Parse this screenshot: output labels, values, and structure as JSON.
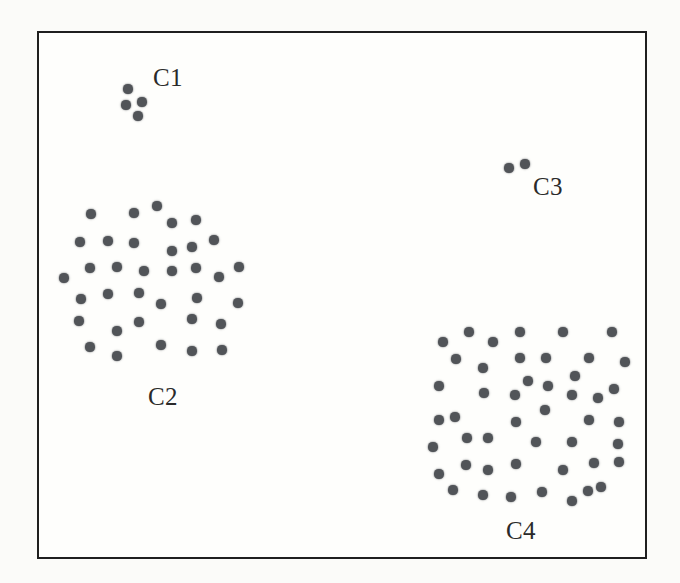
{
  "figure": {
    "page_background": "#fbfbf9",
    "plot_background": "#fefefc",
    "border_color": "#1f1f1f",
    "border_width_px": 2
  },
  "chart_data": {
    "type": "scatter",
    "title": "",
    "xlabel": "",
    "ylabel": "",
    "axes_visible": false,
    "grid": false,
    "legend": false,
    "coordinate_space": "screenshot pixels, origin at top-left",
    "point_color": "#515458",
    "point_radius_px": 4.6,
    "label_color": "#2a2a2a",
    "series": [
      {
        "name": "C1",
        "label": "C1",
        "label_center": [
          168,
          77
        ],
        "points": [
          [
            128,
            89
          ],
          [
            126,
            105
          ],
          [
            142,
            102
          ],
          [
            138,
            116
          ]
        ]
      },
      {
        "name": "C2",
        "label": "C2",
        "label_center": [
          163,
          396
        ],
        "points": [
          [
            91,
            214
          ],
          [
            134,
            213
          ],
          [
            157,
            206
          ],
          [
            172,
            223
          ],
          [
            196,
            220
          ],
          [
            80,
            242
          ],
          [
            108,
            241
          ],
          [
            134,
            243
          ],
          [
            214,
            240
          ],
          [
            172,
            251
          ],
          [
            192,
            247
          ],
          [
            90,
            268
          ],
          [
            117,
            267
          ],
          [
            144,
            271
          ],
          [
            172,
            271
          ],
          [
            196,
            268
          ],
          [
            239,
            267
          ],
          [
            64,
            278
          ],
          [
            219,
            277
          ],
          [
            81,
            299
          ],
          [
            108,
            294
          ],
          [
            139,
            293
          ],
          [
            197,
            298
          ],
          [
            161,
            304
          ],
          [
            238,
            303
          ],
          [
            79,
            321
          ],
          [
            139,
            322
          ],
          [
            192,
            319
          ],
          [
            117,
            331
          ],
          [
            221,
            324
          ],
          [
            90,
            347
          ],
          [
            161,
            345
          ],
          [
            192,
            351
          ],
          [
            222,
            350
          ],
          [
            117,
            356
          ]
        ]
      },
      {
        "name": "C3",
        "label": "C3",
        "label_center": [
          548,
          186
        ],
        "points": [
          [
            509,
            168
          ],
          [
            525,
            164
          ]
        ]
      },
      {
        "name": "C4",
        "label": "C4",
        "label_center": [
          521,
          530
        ],
        "points": [
          [
            443,
            342
          ],
          [
            469,
            332
          ],
          [
            493,
            342
          ],
          [
            520,
            332
          ],
          [
            563,
            332
          ],
          [
            612,
            332
          ],
          [
            456,
            359
          ],
          [
            520,
            358
          ],
          [
            546,
            358
          ],
          [
            589,
            358
          ],
          [
            625,
            362
          ],
          [
            483,
            368
          ],
          [
            575,
            376
          ],
          [
            439,
            386
          ],
          [
            528,
            381
          ],
          [
            548,
            386
          ],
          [
            614,
            389
          ],
          [
            484,
            393
          ],
          [
            515,
            395
          ],
          [
            572,
            395
          ],
          [
            598,
            398
          ],
          [
            545,
            410
          ],
          [
            439,
            420
          ],
          [
            455,
            417
          ],
          [
            516,
            422
          ],
          [
            589,
            420
          ],
          [
            619,
            422
          ],
          [
            467,
            438
          ],
          [
            488,
            438
          ],
          [
            536,
            442
          ],
          [
            572,
            442
          ],
          [
            433,
            447
          ],
          [
            618,
            444
          ],
          [
            466,
            465
          ],
          [
            488,
            470
          ],
          [
            516,
            464
          ],
          [
            439,
            474
          ],
          [
            563,
            470
          ],
          [
            594,
            463
          ],
          [
            619,
            462
          ],
          [
            453,
            490
          ],
          [
            483,
            495
          ],
          [
            511,
            497
          ],
          [
            542,
            492
          ],
          [
            588,
            491
          ],
          [
            601,
            487
          ],
          [
            572,
            501
          ]
        ]
      }
    ]
  }
}
